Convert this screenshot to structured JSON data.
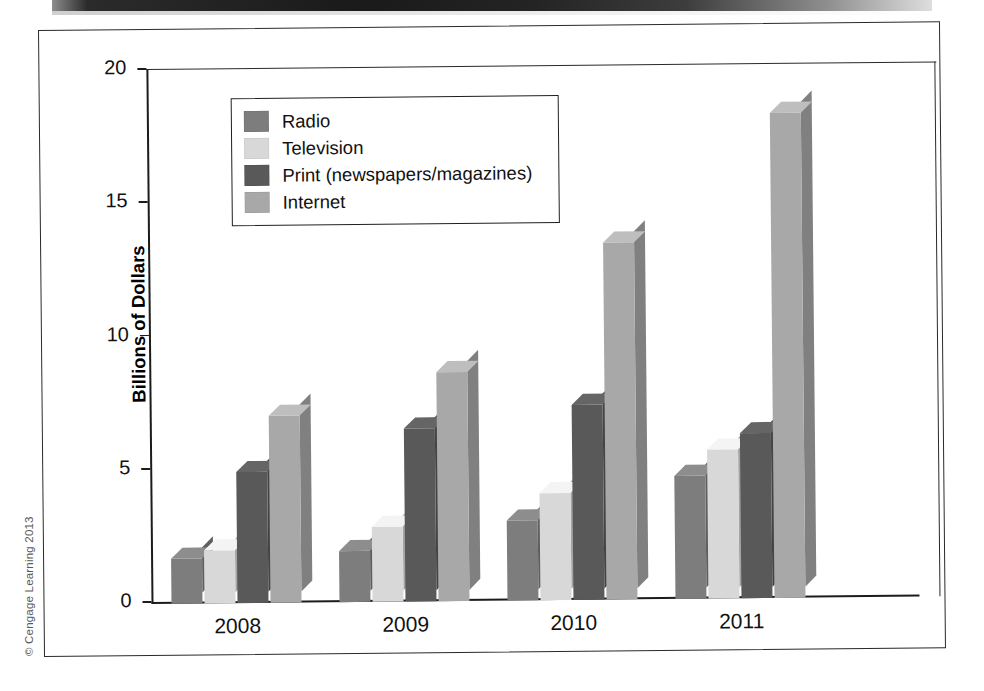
{
  "figure": {
    "copyright": "© Cengage Learning 2013"
  },
  "chart_data": {
    "type": "bar",
    "title": "",
    "subtitle": "",
    "xlabel": "",
    "ylabel": "Billions of Dollars",
    "categories": [
      "2008",
      "2009",
      "2010",
      "2011"
    ],
    "ylim": [
      0,
      20
    ],
    "yticks": [
      0,
      5,
      10,
      15,
      20
    ],
    "ytick_labels": [
      "0",
      "5",
      "10",
      "15",
      "20"
    ],
    "grid": false,
    "legend_position": "top-left",
    "style": "3d-grouped-bar",
    "series": [
      {
        "name": "Radio",
        "color": "#7d7d7d",
        "values": [
          1.7,
          1.9,
          3.0,
          4.6
        ]
      },
      {
        "name": "Television",
        "color": "#d8d8d8",
        "values": [
          2.0,
          2.8,
          4.0,
          5.6
        ]
      },
      {
        "name": "Print (newspapers/magazines)",
        "color": "#595959",
        "values": [
          4.9,
          6.5,
          7.3,
          6.2
        ]
      },
      {
        "name": "Internet",
        "color": "#a8a8a8",
        "values": [
          7.0,
          8.6,
          13.4,
          18.2
        ]
      }
    ]
  }
}
